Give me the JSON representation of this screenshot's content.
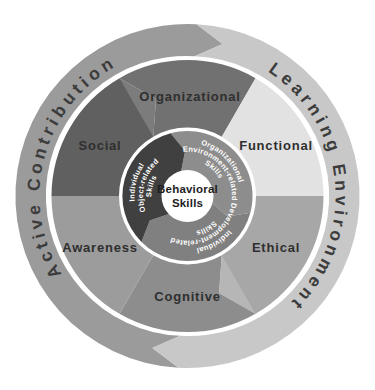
{
  "figure": {
    "center": {
      "line1": "Behavioral",
      "line2": "Skills"
    },
    "inner_ring": {
      "org_env": {
        "line1": "Organizational",
        "line2": "Environment-related",
        "line3": "Skills"
      },
      "development": {
        "line1": "Individual",
        "line2": "Development-related",
        "line3": "Skills"
      },
      "object": {
        "line1": "Individual",
        "line2": "Object-related",
        "line3": "Skills"
      }
    },
    "middle_ring": {
      "organizational": "Organizational",
      "functional": "Functional",
      "ethical": "Ethical",
      "cognitive": "Cognitive",
      "awareness": "Awareness",
      "social": "Social"
    },
    "outer_ring": {
      "left": "Active Contribution",
      "right": "Learning Environment"
    }
  },
  "colors": {
    "background": "#ffffff",
    "outer_left": "#9b9b9b",
    "outer_right": "#c8c8c8",
    "outer_label": "#3c3c3c",
    "middle_organizational": "#717171",
    "middle_functional": "#e2e2e2",
    "middle_ethical": "#a7a7a7",
    "middle_cognitive": "#8d8d8d",
    "middle_awareness": "#9c9c9c",
    "middle_social": "#606060",
    "middle_label": "#2f2f2f",
    "inner_org_env": "#8d8d8d",
    "inner_development": "#808080",
    "inner_object": "#404040",
    "inner_label": "#ffffff",
    "center_bg": "#ffffff",
    "center_label": "#1e1e1e"
  }
}
